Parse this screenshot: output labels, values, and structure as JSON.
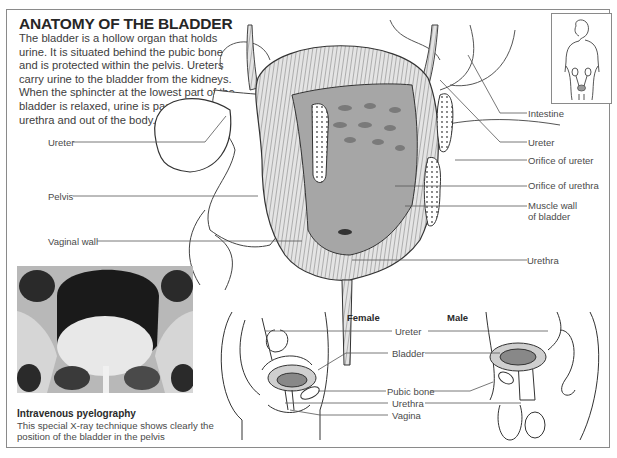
{
  "header": {
    "title": "ANATOMY OF THE BLADDER",
    "intro": "The bladder is a hollow organ that holds urine. It is situated behind the pubic bone and is protected within the pelvis. Ureters carry urine to the bladder from the kidneys. When the sphincter at the lowest part of the bladder is relaxed, urine is passed into the urethra and out of the body."
  },
  "main_diagram": {
    "left_labels": [
      "Ureter",
      "Pelvis",
      "Vaginal wall"
    ],
    "right_labels": [
      "Intestine",
      "Ureter",
      "Orifice of ureter",
      "Orifice of urethra",
      "Muscle wall",
      "of bladder",
      "Urethra"
    ]
  },
  "inset": {
    "icon": "female-body-silhouette-icon"
  },
  "xray": {
    "caption_title": "Intravenous pyelography",
    "caption_text": "This special X-ray technique shows clearly the position of the bladder in the pelvis"
  },
  "cross_sections": {
    "female_title": "Female",
    "male_title": "Male",
    "labels": [
      "Ureter",
      "Bladder",
      "Pubic bone",
      "Urethra",
      "Vagina"
    ]
  },
  "colors": {
    "line": "#4a4a4a",
    "frame": "#8a8a8a",
    "bladder_fill": "#9a9a9a",
    "muscle_fill": "#d4d4d4"
  }
}
